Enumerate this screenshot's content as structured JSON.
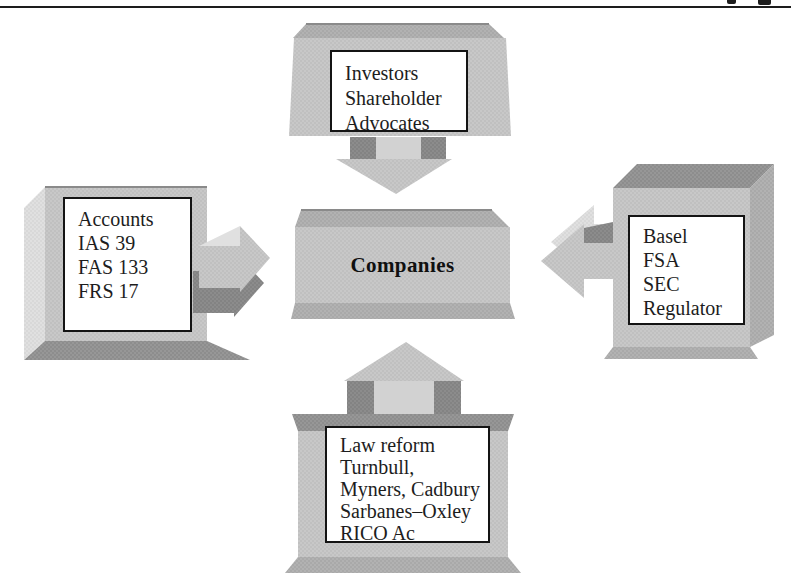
{
  "diagram": {
    "center": {
      "label": "Companies"
    },
    "sources": {
      "top": {
        "lines": [
          "Investors",
          "Shareholder",
          "Advocates"
        ],
        "arrow": "down",
        "target": "Companies"
      },
      "left": {
        "lines": [
          "Accounts",
          "IAS 39",
          "FAS 133",
          "FRS 17"
        ],
        "arrow": "right",
        "target": "Companies"
      },
      "right": {
        "lines": [
          "Basel",
          "FSA",
          "SEC",
          "Regulator"
        ],
        "arrow": "left",
        "target": "Companies"
      },
      "bottom": {
        "lines": [
          "Law reform",
          "Turnbull,",
          "Myners, Cadbury",
          "Sarbanes–Oxley",
          "RICO Ac"
        ],
        "arrow": "up",
        "target": "Companies"
      }
    }
  },
  "theme": {
    "ink": "#1d1d1d",
    "paper": "#ffffff",
    "label-border": "#141414",
    "label-bg": "#ffffff",
    "slab-face": "#c8c8c8",
    "slab-face-dot": "#b6b6b6",
    "slab-mid": "#b2b2b2",
    "slab-mid-dot": "#9e9e9e",
    "slab-dark": "#979797",
    "slab-dark-dot": "#808080",
    "slab-light": "#e0e0e0",
    "slab-light-dot": "#cfcfcf",
    "arrow-wall": "#8c8c8c",
    "arrow-wall-dot": "#777777",
    "slab-shaft": "#d2d2d2"
  }
}
